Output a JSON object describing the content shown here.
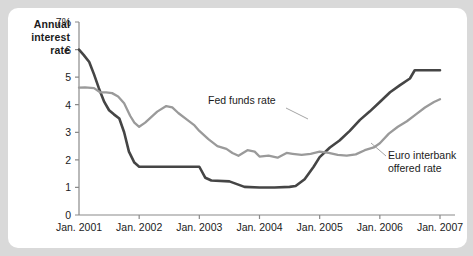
{
  "chart_data": {
    "type": "line",
    "title": "Annual interest rate",
    "title_lines": [
      "Annual",
      "interest",
      "rate"
    ],
    "xlabel": "",
    "ylabel": "Annual interest rate",
    "ylim": [
      0,
      7
    ],
    "xlim": [
      "Jan. 2001",
      "Jan. 2007"
    ],
    "grid": false,
    "legend_position": "inline-annotations",
    "ytick_labels": [
      "7%",
      "6",
      "5",
      "4",
      "3",
      "2",
      "1",
      "0"
    ],
    "ytick_values": [
      7,
      6,
      5,
      4,
      3,
      2,
      1,
      0
    ],
    "xtick_labels": [
      "Jan. 2001",
      "Jan. 2002",
      "Jan. 2003",
      "Jan. 2004",
      "Jan. 2005",
      "Jan. 2006",
      "Jan. 2007"
    ],
    "xtick_values": [
      2001,
      2002,
      2003,
      2004,
      2005,
      2006,
      2007
    ],
    "annotations": [
      {
        "text": "Fed funds rate",
        "series": "Fed funds rate"
      },
      {
        "text": "Euro interbank offered rate",
        "lines": [
          "Euro interbank",
          "offered rate"
        ],
        "series": "Euro interbank offered rate"
      }
    ],
    "series": [
      {
        "name": "Fed funds rate",
        "color": "#454545",
        "x": [
          2001.0,
          2001.08,
          2001.17,
          2001.25,
          2001.33,
          2001.42,
          2001.5,
          2001.58,
          2001.67,
          2001.75,
          2001.83,
          2001.92,
          2002.0,
          2002.25,
          2002.5,
          2002.75,
          2002.92,
          2003.0,
          2003.1,
          2003.2,
          2003.5,
          2003.75,
          2004.0,
          2004.25,
          2004.5,
          2004.6,
          2004.75,
          2004.9,
          2005.0,
          2005.17,
          2005.33,
          2005.5,
          2005.67,
          2005.83,
          2006.0,
          2006.17,
          2006.33,
          2006.5,
          2006.58,
          2006.75,
          2006.92,
          2007.0
        ],
        "values": [
          6.0,
          5.8,
          5.55,
          5.1,
          4.6,
          4.1,
          3.8,
          3.65,
          3.5,
          3.0,
          2.3,
          1.9,
          1.75,
          1.75,
          1.75,
          1.75,
          1.75,
          1.75,
          1.35,
          1.25,
          1.22,
          1.02,
          1.0,
          1.0,
          1.02,
          1.05,
          1.3,
          1.75,
          2.1,
          2.45,
          2.7,
          3.05,
          3.45,
          3.75,
          4.1,
          4.45,
          4.7,
          4.95,
          5.25,
          5.25,
          5.25,
          5.25
        ]
      },
      {
        "name": "Euro interbank offered rate",
        "color": "#9a9a9a",
        "x": [
          2001.0,
          2001.1,
          2001.25,
          2001.35,
          2001.45,
          2001.55,
          2001.65,
          2001.75,
          2001.85,
          2001.92,
          2002.0,
          2002.1,
          2002.2,
          2002.3,
          2002.45,
          2002.55,
          2002.65,
          2002.8,
          2002.92,
          2003.0,
          2003.15,
          2003.3,
          2003.45,
          2003.55,
          2003.65,
          2003.8,
          2003.92,
          2004.0,
          2004.15,
          2004.3,
          2004.45,
          2004.55,
          2004.7,
          2004.85,
          2005.0,
          2005.15,
          2005.3,
          2005.45,
          2005.6,
          2005.75,
          2005.9,
          2006.0,
          2006.15,
          2006.3,
          2006.45,
          2006.6,
          2006.75,
          2006.9,
          2007.0
        ],
        "values": [
          4.62,
          4.63,
          4.6,
          4.45,
          4.45,
          4.42,
          4.3,
          4.05,
          3.6,
          3.35,
          3.2,
          3.35,
          3.55,
          3.75,
          3.95,
          3.9,
          3.7,
          3.45,
          3.25,
          3.05,
          2.75,
          2.5,
          2.4,
          2.25,
          2.15,
          2.35,
          2.3,
          2.12,
          2.15,
          2.08,
          2.25,
          2.22,
          2.18,
          2.22,
          2.3,
          2.25,
          2.18,
          2.15,
          2.2,
          2.35,
          2.45,
          2.6,
          2.95,
          3.2,
          3.4,
          3.65,
          3.9,
          4.1,
          4.2
        ]
      }
    ]
  }
}
